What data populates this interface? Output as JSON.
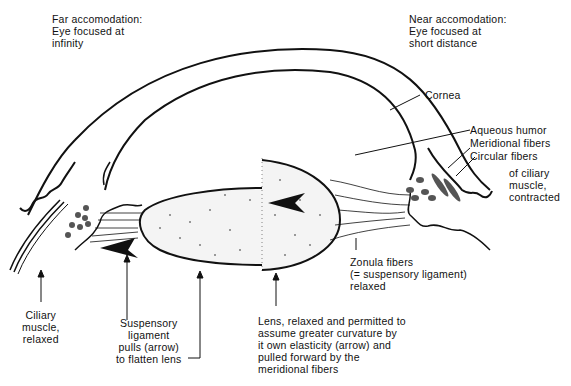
{
  "diagram": {
    "title_left": "Far accomodation:\nEye focused at\ninfinity",
    "title_right": "Near accomodation:\nEye focused at\nshort distance",
    "labels": {
      "cornea": "Cornea",
      "aqueous_humor": "Aqueous humor",
      "meridional_fibers": "Meridional fibers",
      "circular_fibers": "Circular fibers",
      "ciliary_contracted": "of ciliary\nmuscle,\ncontracted",
      "ciliary_relaxed": "Ciliary\nmuscle,\nrelaxed",
      "suspensory_ligament": "Suspensory\nligament\npulls (arrow)\nto flatten lens",
      "zonula_fibers": "Zonula fibers\n(= suspensory ligament)\nrelaxed",
      "lens_relaxed": "Lens, relaxed and permitted to\nassume greater curvature by\nit own elasticity (arrow) and\npulled forward by the\nmeridional fibers"
    },
    "colors": {
      "ink": "#111111",
      "background": "#ffffff",
      "muscle_fill": "#555555"
    }
  }
}
